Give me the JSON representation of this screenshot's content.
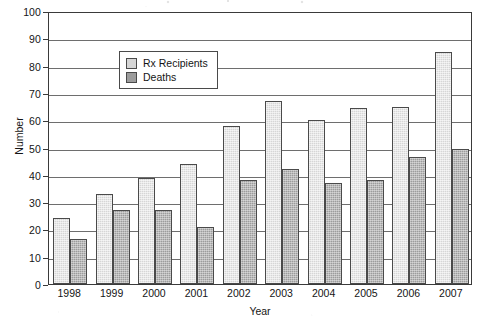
{
  "chart_data": {
    "type": "bar",
    "title": "",
    "xlabel": "Year",
    "ylabel": "Number",
    "categories": [
      "1998",
      "1999",
      "2000",
      "2001",
      "2002",
      "2003",
      "2004",
      "2005",
      "2006",
      "2007"
    ],
    "series": [
      {
        "name": "Rx Recipients",
        "color": "#d6d6d6",
        "values": [
          24,
          33,
          39,
          44,
          58,
          67,
          60,
          64.5,
          65,
          85
        ]
      },
      {
        "name": "Deaths",
        "color": "#9c9c9c",
        "values": [
          16.5,
          27,
          27,
          21,
          38,
          42,
          37,
          38,
          46.5,
          49.5
        ]
      }
    ],
    "ylim": [
      0,
      100
    ],
    "ytick_step": 10,
    "yticks": [
      "0",
      "10",
      "20",
      "30",
      "40",
      "50",
      "60",
      "70",
      "80",
      "90",
      "100"
    ],
    "grid": true,
    "legend_position": "top-left",
    "legend_entries": [
      "Rx Recipients",
      "Deaths"
    ]
  },
  "axes": {
    "y_title": "Number",
    "x_title": "Year"
  },
  "legend": {
    "entries": [
      {
        "label": "Rx Recipients",
        "swatch": "rx"
      },
      {
        "label": "Deaths",
        "swatch": "deaths"
      }
    ]
  },
  "colors": {
    "rx_recipients": "#d6d6d6",
    "deaths": "#9c9c9c",
    "axis": "#3a3a3a",
    "gridline": "#6e6e6e",
    "background": "#ffffff"
  }
}
